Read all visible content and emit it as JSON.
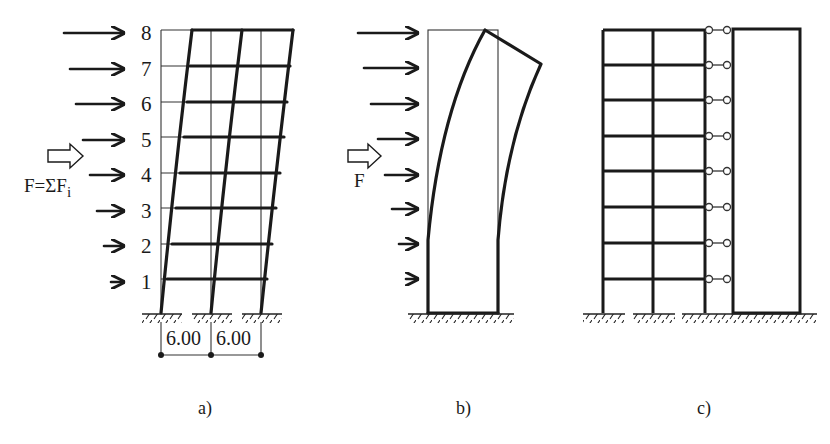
{
  "figure": {
    "panels": [
      {
        "id": "a",
        "caption": "a)",
        "description": "8-storey two-bay frame, undeformed and deformed shape under lateral floor loads",
        "floor_labels": [
          "8",
          "7",
          "6",
          "5",
          "4",
          "3",
          "2",
          "1"
        ],
        "resultant_label": "F=ΣF",
        "resultant_subscript": "i",
        "bay_widths": [
          "6.00",
          "6.00"
        ]
      },
      {
        "id": "b",
        "caption": "b)",
        "description": "Shear wall, undeformed and deformed (bending) shape",
        "resultant_label": "F"
      },
      {
        "id": "c",
        "caption": "c)",
        "description": "Frame linked to shear wall with pinned link members at each floor",
        "floors": 8
      }
    ]
  }
}
